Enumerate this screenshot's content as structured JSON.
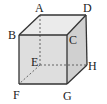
{
  "diagram": {
    "colors": {
      "edge": "#333333",
      "front": "#dcdcdc",
      "top": "#e8e8e8",
      "side": "#d2d2d2",
      "hidden": "#555555"
    },
    "vertices": {
      "A": {
        "label": "A",
        "x": 40,
        "y": 15
      },
      "B": {
        "label": "B",
        "x": 19,
        "y": 35
      },
      "C": {
        "label": "C",
        "x": 67,
        "y": 35
      },
      "D": {
        "label": "D",
        "x": 86,
        "y": 15
      },
      "E": {
        "label": "E",
        "x": 40,
        "y": 65
      },
      "F": {
        "label": "F",
        "x": 19,
        "y": 84
      },
      "G": {
        "label": "G",
        "x": 67,
        "y": 84
      },
      "H": {
        "label": "H",
        "x": 87,
        "y": 65
      }
    },
    "visible_edges": [
      "AB",
      "AD",
      "BC",
      "CD",
      "BF",
      "CG",
      "DH",
      "FG",
      "GH"
    ],
    "hidden_edges": [
      "AE",
      "EF",
      "EH"
    ]
  }
}
